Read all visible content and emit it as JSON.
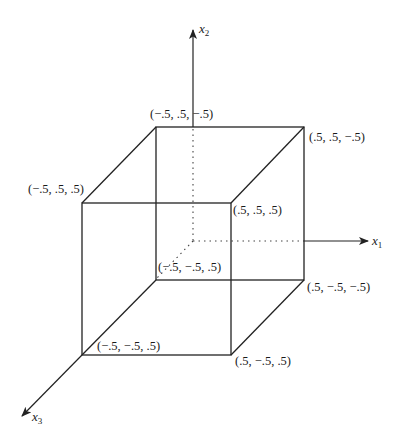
{
  "diagram": {
    "type": "3d-cube-axes",
    "axes": {
      "x1": {
        "name": "x",
        "subscript": "1"
      },
      "x2": {
        "name": "x",
        "subscript": "2"
      },
      "x3": {
        "name": "x",
        "subscript": "3"
      }
    },
    "vertices": [
      {
        "id": "back-top-left",
        "label": "(−.5, .5, −.5)"
      },
      {
        "id": "back-top-right",
        "label": "(.5, .5, −.5)"
      },
      {
        "id": "front-top-left",
        "label": "(−.5, .5, .5)"
      },
      {
        "id": "front-top-right",
        "label": "(.5, .5, .5)"
      },
      {
        "id": "back-bottom-left",
        "label": "(−.5, −.5, .5)"
      },
      {
        "id": "back-bottom-right",
        "label": "(.5, −.5, −.5)"
      },
      {
        "id": "front-bottom-left",
        "label": "(−.5, −.5, .5)"
      },
      {
        "id": "front-bottom-right",
        "label": "(.5, −.5, .5)"
      }
    ]
  }
}
